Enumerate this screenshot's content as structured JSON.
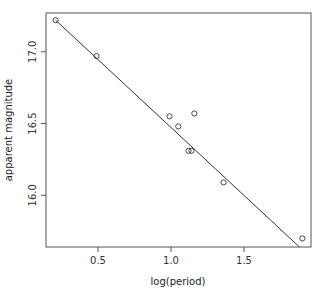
{
  "chart_data": {
    "type": "scatter",
    "title": "",
    "xlabel": "log(period)",
    "ylabel": "apparent magnitude",
    "xlim": [
      0.144,
      1.959
    ],
    "ylim": [
      15.64,
      17.27
    ],
    "xticks": [
      0.5,
      1.0,
      1.5
    ],
    "xtick_labels": [
      "0.5",
      "1.0",
      "1.5"
    ],
    "yticks": [
      16.0,
      16.5,
      17.0
    ],
    "ytick_labels": [
      "16.0",
      "16.5",
      "17.0"
    ],
    "grid": false,
    "legend": null,
    "series": [
      {
        "name": "observations",
        "marker": "open-circle",
        "x": [
          0.21,
          0.49,
          0.99,
          1.05,
          1.16,
          1.12,
          1.14,
          1.36,
          1.9
        ],
        "y": [
          17.22,
          16.97,
          16.55,
          16.48,
          16.57,
          16.31,
          16.31,
          16.09,
          15.7
        ]
      },
      {
        "name": "fitted line",
        "type": "line",
        "x": [
          0.21,
          1.88
        ],
        "y": [
          17.22,
          15.64
        ]
      }
    ]
  },
  "labels": {
    "xlabel": "log(period)",
    "ylabel": "apparent magnitude",
    "xticks": [
      "0.5",
      "1.0",
      "1.5"
    ],
    "yticks": [
      "16.0",
      "16.5",
      "17.0"
    ]
  }
}
